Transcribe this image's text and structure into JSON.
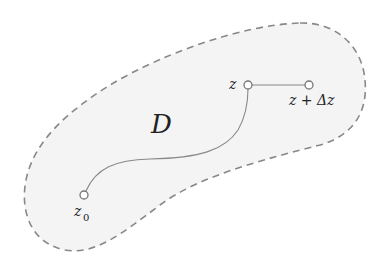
{
  "diagram": {
    "region": {
      "label": "D",
      "fill_color": "#f4f4f4",
      "border_color": "#888888",
      "border_style": "dashed"
    },
    "points": [
      {
        "id": "z0",
        "label_main": "z",
        "label_sub": "0",
        "cx": 84,
        "cy": 195
      },
      {
        "id": "z",
        "label_main": "z",
        "cx": 248,
        "cy": 85
      },
      {
        "id": "z_plus_dz",
        "label_main": "z + Δz",
        "cx": 309,
        "cy": 85
      }
    ],
    "curve": {
      "from": "z0",
      "to": "z",
      "color": "#888888"
    },
    "segment": {
      "from": "z",
      "to": "z_plus_dz",
      "color": "#888888"
    },
    "text_color": "#222222"
  }
}
